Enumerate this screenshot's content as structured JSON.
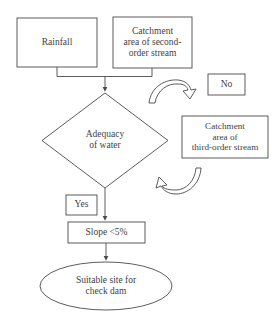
{
  "diagram": {
    "background_color": "#ffffff",
    "stroke_color": "#4a4a4a",
    "text_color": "#3f3f3f",
    "nodes": {
      "rainfall": {
        "label": "Rainfall",
        "shape": "rectangle"
      },
      "second_order": {
        "label": "Catchment\narea of second-\norder stream",
        "shape": "rectangle"
      },
      "no": {
        "label": "No",
        "shape": "rectangle"
      },
      "third_order": {
        "label": "Catchment\narea of\nthird-order stream",
        "shape": "rectangle"
      },
      "adequacy": {
        "label": "Adequacy\nof water",
        "shape": "diamond"
      },
      "yes": {
        "label": "Yes",
        "shape": "rectangle"
      },
      "slope": {
        "label": "Slope <5%",
        "shape": "rectangle"
      },
      "suitable": {
        "label": "Suitable site for\ncheck dam",
        "shape": "ellipse"
      }
    },
    "connectors": [
      {
        "from": "rainfall",
        "to": "adequacy",
        "type": "elbow-arrow"
      },
      {
        "from": "second_order",
        "to": "adequacy",
        "type": "elbow-arrow"
      },
      {
        "from": "adequacy",
        "to": "no",
        "type": "curved-ribbon-arrow"
      },
      {
        "from": "third_order",
        "to": "adequacy",
        "type": "curved-ribbon-arrow"
      },
      {
        "from": "adequacy",
        "to": "slope",
        "type": "straight-arrow"
      },
      {
        "from": "slope",
        "to": "suitable",
        "type": "straight-arrow"
      }
    ]
  }
}
